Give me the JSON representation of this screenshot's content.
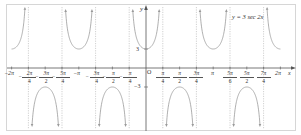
{
  "chart_data": {
    "type": "line",
    "title": "",
    "function_label": "y = 3 sec 2x",
    "xlabel": "x",
    "ylabel": "y",
    "origin_label": "O",
    "xlim": [
      -6.283,
      6.283
    ],
    "ylim": [
      -6.5,
      6.5
    ],
    "grid": false,
    "x_ticks": [
      {
        "value": -6.2832,
        "label": "−2π"
      },
      {
        "value": -5.4978,
        "label_num": "7π",
        "label_den": "4",
        "neg": true,
        "shown_num": "7π"
      },
      {
        "value": -4.7124,
        "label_num": "3π",
        "label_den": "2",
        "neg": true
      },
      {
        "value": -3.927,
        "label_num": "5π",
        "label_den": "4",
        "neg": true
      },
      {
        "value": -3.1416,
        "label": "−π"
      },
      {
        "value": -2.3562,
        "label_num": "3π",
        "label_den": "4",
        "neg": true
      },
      {
        "value": -1.5708,
        "label_num": "π",
        "label_den": "2",
        "neg": true
      },
      {
        "value": -0.7854,
        "label_num": "π",
        "label_den": "4",
        "neg": true
      },
      {
        "value": 0.7854,
        "label_num": "π",
        "label_den": "4"
      },
      {
        "value": 1.5708,
        "label_num": "π",
        "label_den": "2"
      },
      {
        "value": 2.3562,
        "label_num": "3π",
        "label_den": "4"
      },
      {
        "value": 3.1416,
        "label": "π"
      },
      {
        "value": 3.927,
        "label_num": "5π",
        "label_den": "6"
      },
      {
        "value": 4.7124,
        "label_num": "3π",
        "label_den": "2"
      },
      {
        "value": 5.4978,
        "label_num": "7π",
        "label_den": "4"
      },
      {
        "value": 6.2832,
        "label": "2π"
      }
    ],
    "x_tick_labels_as_displayed": [
      "−2π",
      "−2π/4",
      "−3π/2",
      "−5π/4",
      "−π",
      "−3π/4",
      "−π/2",
      "−π/4",
      "π/4",
      "π/2",
      "3π/4",
      "π",
      "5π/6",
      "5π/2",
      "7π/4",
      "2π"
    ],
    "y_ticks": [
      {
        "value": 3,
        "label": "3"
      },
      {
        "value": -3,
        "label": "−3"
      }
    ],
    "asymptotes": [
      -5.4978,
      -3.927,
      -2.3562,
      -0.7854,
      0.7854,
      2.3562,
      3.927,
      5.4978
    ],
    "series": [
      {
        "name": "y = 3 sec 2x",
        "expression": "3/cos(2x)",
        "color": "#9a9a9a",
        "style": "solid"
      }
    ],
    "key_points": [
      {
        "x": -6.2832,
        "y": 3
      },
      {
        "x": -4.7124,
        "y": -3
      },
      {
        "x": -3.1416,
        "y": 3
      },
      {
        "x": -1.5708,
        "y": -3
      },
      {
        "x": 0,
        "y": 3
      },
      {
        "x": 1.5708,
        "y": -3
      },
      {
        "x": 3.1416,
        "y": 3
      },
      {
        "x": 4.7124,
        "y": -3
      },
      {
        "x": 6.2832,
        "y": 3
      }
    ]
  },
  "labels": {
    "equation": "y = 3 sec 2x",
    "x_axis": "x",
    "y_axis": "y",
    "origin": "O",
    "y3": "3",
    "ym3": "−3",
    "neg2pi": "−2π",
    "negpi": "−π",
    "pi": "π",
    "twopi": "2π"
  },
  "colors": {
    "curve": "#9a9a9a",
    "asymptote": "#b0b0b0",
    "axis": "#555555",
    "frame": "#d6d6d6"
  }
}
